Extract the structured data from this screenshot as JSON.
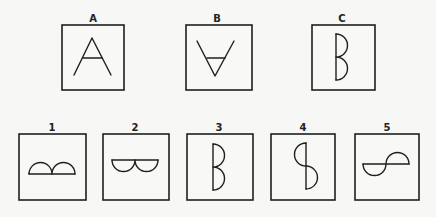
{
  "figure": {
    "top_row": [
      {
        "label": "A",
        "description": "Letter A shape"
      },
      {
        "label": "B",
        "description": "Inverted letter A shape"
      },
      {
        "label": "C",
        "description": "Letter B shape made of two semicircles on a vertical line"
      }
    ],
    "bottom_row": [
      {
        "label": "1",
        "description": "Two semicircles bulging upward on a horizontal line"
      },
      {
        "label": "2",
        "description": "Two semicircles bulging downward under a horizontal line"
      },
      {
        "label": "3",
        "description": "Two semicircles bulging right on a vertical line"
      },
      {
        "label": "4",
        "description": "Semicircle left on top, semicircle right on bottom of a vertical line"
      },
      {
        "label": "5",
        "description": "Semicircle down on left, semicircle up on right of a horizontal line"
      }
    ],
    "colors": {
      "background": "#f7f7f5",
      "stroke": "#1e1e1e"
    }
  }
}
